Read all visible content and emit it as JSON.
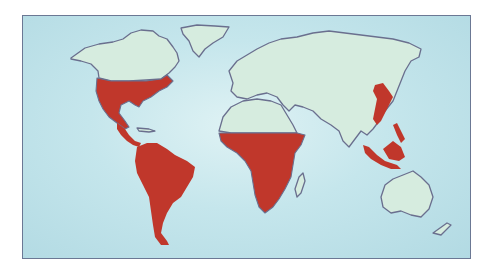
{
  "map": {
    "type": "world-distribution-map",
    "projection": "equirectangular-like",
    "colors": {
      "ocean": "#c5e6ec",
      "land": "#d6ecdf",
      "outline": "#6a6f8e",
      "highlight": "#c0372b",
      "frame": "#6b7894"
    },
    "highlighted_regions": [
      {
        "name": "North America (USA & Mexico)"
      },
      {
        "name": "Central America"
      },
      {
        "name": "South America"
      },
      {
        "name": "Sub-Saharan Africa"
      },
      {
        "name": "Eastern China & Korea"
      },
      {
        "name": "Philippines"
      },
      {
        "name": "Indonesia & Malaysia (Southeast Asia)"
      }
    ],
    "non_highlighted_regions": [
      {
        "name": "Canada & Alaska"
      },
      {
        "name": "Greenland"
      },
      {
        "name": "Europe"
      },
      {
        "name": "North Africa"
      },
      {
        "name": "Russia & Central Asia"
      },
      {
        "name": "Middle East"
      },
      {
        "name": "India"
      },
      {
        "name": "Australia"
      },
      {
        "name": "New Zealand"
      },
      {
        "name": "Madagascar"
      }
    ]
  }
}
